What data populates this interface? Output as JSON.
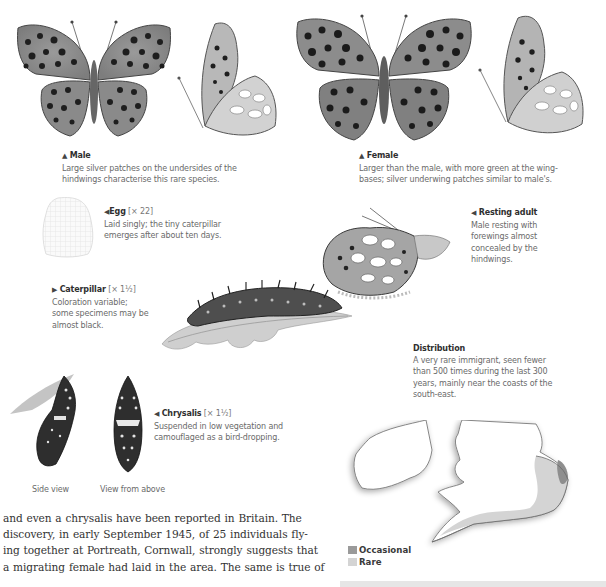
{
  "figures": {
    "male": {
      "marker": "▲",
      "title": "Male",
      "text_line1": "Large silver patches on the undersides of the",
      "text_line2": "hindwings characterise this rare species."
    },
    "female": {
      "marker": "▲",
      "title": "Female",
      "text_line1": "Larger than the male, with more green at the wing-",
      "text_line2": "bases; silver underwing patches similar to male's."
    },
    "egg": {
      "marker": "◀",
      "title": "Egg",
      "scale": "[× 22]",
      "text_line1": "Laid singly; the tiny caterpillar",
      "text_line2": "emerges after about ten days."
    },
    "resting_adult": {
      "marker": "◀",
      "title": "Resting adult",
      "text_line1": "Male resting with",
      "text_line2": "forewings almost",
      "text_line3": "concealed by the",
      "text_line4": "hindwings."
    },
    "caterpillar": {
      "marker": "▶",
      "title": "Caterpillar",
      "scale": "[× 1½]",
      "text_line1": "Coloration variable;",
      "text_line2": "some specimens may be",
      "text_line3": "almost black."
    },
    "chrysalis": {
      "marker": "◀",
      "title": "Chrysalis",
      "scale": "[× 1½]",
      "text_line1": "Suspended in low vegetation and",
      "text_line2": "camouflaged as a bird-dropping.",
      "side_label": "Side view",
      "top_label": "View from above"
    }
  },
  "distribution": {
    "title": "Distribution",
    "text_line1": "A very rare immigrant, seen fewer",
    "text_line2": "than 500 times during the last 300",
    "text_line3": "years, mainly near the coasts of the",
    "text_line4": "south-east.",
    "legend": [
      {
        "label": "Occasional",
        "color": "#9a9a9a"
      },
      {
        "label": "Rare",
        "color": "#d4d4d4"
      }
    ]
  },
  "body_text": {
    "line1": "and even a chrysalis have been reported in Britain. The",
    "line2": "discovery, in early September 1945, of 25 individuals fly-",
    "line3": "ing together at Portreath, Cornwall, strongly suggests that",
    "line4": "a migrating female had laid in the area. The same is true of"
  }
}
